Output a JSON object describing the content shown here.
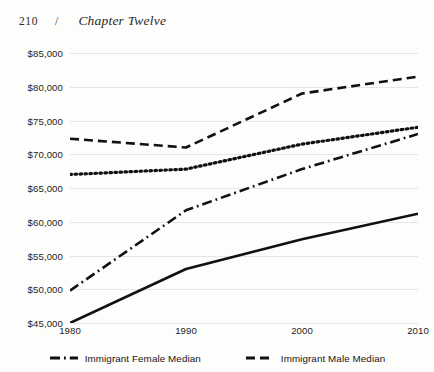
{
  "running_head": {
    "folio": "210",
    "separator": "/",
    "chapter_title": "Chapter Twelve"
  },
  "chart_data": {
    "type": "line",
    "title": "",
    "xlabel": "",
    "ylabel": "",
    "x": [
      1980,
      1990,
      2000,
      2010
    ],
    "xticklabels": [
      "1980",
      "1990",
      "2000",
      "2010"
    ],
    "xlim": [
      1980,
      2010
    ],
    "ylim": [
      45000,
      85000
    ],
    "yticks": [
      45000,
      50000,
      55000,
      60000,
      65000,
      70000,
      75000,
      80000,
      85000
    ],
    "yticklabels": [
      "$45,000",
      "$50,000",
      "$55,000",
      "$60,000",
      "$65,000",
      "$70,000",
      "$75,000",
      "$80,000",
      "$85,000"
    ],
    "grid": true,
    "grid_axis": "y",
    "legend_position": "bottom",
    "series": [
      {
        "name": "Immigrant Male Median",
        "linestyle": "dashed",
        "color": "#111111",
        "in_legend": true,
        "values": [
          72300,
          71000,
          79000,
          81500
        ]
      },
      {
        "name": "Native-born Male Median",
        "linestyle": "dotted",
        "color": "#111111",
        "in_legend": false,
        "values": [
          67000,
          67800,
          71500,
          74000
        ]
      },
      {
        "name": "Immigrant Female Median",
        "linestyle": "dashdot",
        "color": "#111111",
        "in_legend": true,
        "values": [
          49800,
          61700,
          67800,
          73000
        ]
      },
      {
        "name": "Native-born Female Median",
        "linestyle": "solid",
        "color": "#111111",
        "in_legend": false,
        "values": [
          45000,
          53000,
          57400,
          61200
        ]
      }
    ]
  },
  "legend": {
    "items": [
      {
        "label": "Immigrant Female Median",
        "linestyle": "dashdot"
      },
      {
        "label": "Immigrant Male Median",
        "linestyle": "dashed"
      }
    ]
  }
}
